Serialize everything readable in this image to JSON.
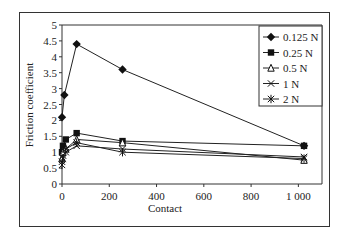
{
  "chart_data": {
    "type": "line",
    "title": "",
    "xlabel": "Contact",
    "ylabel": "Friction coefficient",
    "xlim": [
      0,
      1100
    ],
    "ylim": [
      0,
      5
    ],
    "xticks": [
      0,
      200,
      400,
      600,
      800,
      1000
    ],
    "xtick_labels": [
      "0",
      "200",
      "400",
      "600",
      "800",
      "1 000"
    ],
    "yticks": [
      0,
      0.5,
      1,
      1.5,
      2,
      2.5,
      3,
      3.5,
      4,
      4.5,
      5
    ],
    "ytick_labels": [
      "0",
      "0.5",
      "1",
      "1.5",
      "2",
      "2.5",
      "3",
      "3.5",
      "4",
      "4.5",
      "5"
    ],
    "grid": false,
    "legend_position": "upper right",
    "series": [
      {
        "name": "0.125 N",
        "marker": "diamond",
        "points": [
          [
            0,
            2.1
          ],
          [
            10,
            2.8
          ],
          [
            62,
            4.4
          ],
          [
            256,
            3.6
          ],
          [
            1024,
            1.2
          ]
        ]
      },
      {
        "name": "0.25 N",
        "marker": "square",
        "points": [
          [
            0,
            1.0
          ],
          [
            4,
            1.2
          ],
          [
            16,
            1.4
          ],
          [
            62,
            1.6
          ],
          [
            256,
            1.35
          ],
          [
            1024,
            1.2
          ]
        ]
      },
      {
        "name": "0.5 N",
        "marker": "triangle-open",
        "points": [
          [
            0,
            0.8
          ],
          [
            4,
            1.0
          ],
          [
            16,
            1.1
          ],
          [
            62,
            1.4
          ],
          [
            256,
            1.3
          ],
          [
            1024,
            0.75
          ]
        ]
      },
      {
        "name": "1 N",
        "marker": "x",
        "points": [
          [
            0,
            0.7
          ],
          [
            4,
            0.9
          ],
          [
            16,
            1.0
          ],
          [
            62,
            1.2
          ],
          [
            256,
            1.1
          ],
          [
            1024,
            0.85
          ]
        ]
      },
      {
        "name": "2 N",
        "marker": "asterisk",
        "points": [
          [
            0,
            0.6
          ],
          [
            4,
            0.8
          ],
          [
            16,
            1.1
          ],
          [
            62,
            1.3
          ],
          [
            256,
            1.0
          ],
          [
            1024,
            0.8
          ]
        ]
      }
    ]
  }
}
